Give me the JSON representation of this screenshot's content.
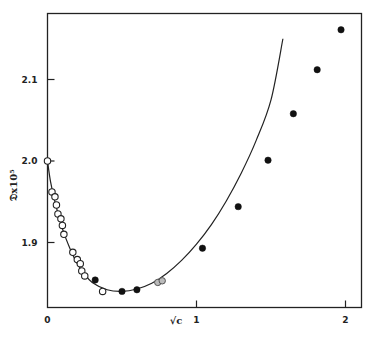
{
  "chart_data": {
    "type": "scatter",
    "title": "",
    "xlabel": "√c",
    "ylabel": "𝔇x10⁵",
    "xlim": [
      0,
      2.1
    ],
    "ylim": [
      1.82,
      2.18
    ],
    "grid": false,
    "legend": null,
    "x_ticks": [
      {
        "value": 0,
        "label": "0"
      },
      {
        "value": 1,
        "label": "1"
      },
      {
        "value": 2,
        "label": "2"
      }
    ],
    "y_ticks": [
      {
        "value": 1.9,
        "label": "1.9"
      },
      {
        "value": 2.0,
        "label": "2.0"
      },
      {
        "value": 2.1,
        "label": "2.1"
      }
    ],
    "series": [
      {
        "name": "open circles",
        "marker": "open-circle",
        "x": [
          0,
          0.03,
          0.05,
          0.06,
          0.07,
          0.09,
          0.1,
          0.11,
          0.17,
          0.2,
          0.22,
          0.23,
          0.25,
          0.37
        ],
        "y": [
          2.0,
          1.962,
          1.956,
          1.946,
          1.935,
          1.929,
          1.921,
          1.91,
          1.888,
          1.879,
          1.874,
          1.865,
          1.859,
          1.84
        ]
      },
      {
        "name": "filled circles",
        "marker": "filled-circle",
        "x": [
          0.32,
          0.5,
          0.6,
          1.04,
          1.28,
          1.48,
          1.65,
          1.81,
          1.97
        ],
        "y": [
          1.854,
          1.84,
          1.842,
          1.893,
          1.944,
          2.001,
          2.058,
          2.112,
          2.161
        ]
      },
      {
        "name": "gray circles",
        "marker": "gray-circle",
        "x": [
          0.74,
          0.77
        ],
        "y": [
          1.851,
          1.853
        ]
      },
      {
        "name": "theoretical curve",
        "type": "line",
        "x": [
          0,
          0.02,
          0.05,
          0.1,
          0.15,
          0.2,
          0.25,
          0.3,
          0.4,
          0.5,
          0.6,
          0.7,
          0.8,
          0.9,
          1.0,
          1.1,
          1.2,
          1.3,
          1.4,
          1.5,
          1.58
        ],
        "y": [
          2.0,
          1.975,
          1.95,
          1.917,
          1.893,
          1.874,
          1.861,
          1.851,
          1.842,
          1.84,
          1.843,
          1.85,
          1.862,
          1.878,
          1.898,
          1.922,
          1.951,
          1.985,
          2.025,
          2.075,
          2.15
        ]
      }
    ]
  },
  "axes": {
    "x_axis_label": "√c",
    "y_axis_label": "𝔇x10⁵"
  }
}
